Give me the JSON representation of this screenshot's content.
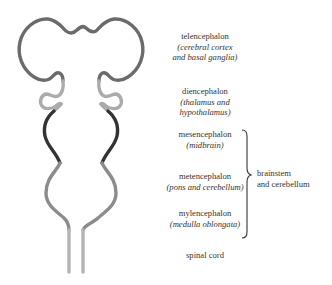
{
  "diagram": {
    "regions": [
      {
        "id": "telencephalon",
        "name": "telencephalon",
        "sub_open": "(",
        "sub": "cerebral cortex and basal ganglia",
        "sub_line1": "cerebral cortex",
        "sub_line2": "and basal ganglia",
        "color": "#6b6b6b"
      },
      {
        "id": "diencephalon",
        "name": "diencephalon",
        "sub_line1": "thalamus and",
        "sub_line2": "hypothalamus",
        "color": "#ababab"
      },
      {
        "id": "mesencephalon",
        "name": "mesencephalon",
        "sub_line1": "midbrain",
        "color": "#333333"
      },
      {
        "id": "metencephalon",
        "name": "metencephalon",
        "sub_line1": "pons and cerebellum",
        "color": "#8c8c8c"
      },
      {
        "id": "mylencephalon",
        "name": "mylencephalon",
        "sub_line1": "medulla oblongata",
        "color": "#8c8c8c"
      },
      {
        "id": "spinal-cord",
        "name": "spinal cord",
        "color": "#b3b3b3"
      }
    ],
    "group": {
      "line1": "brainstem",
      "line2": "and cerebellum"
    }
  }
}
